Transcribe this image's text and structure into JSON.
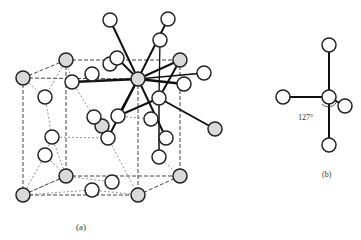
{
  "figure": {
    "panel_a": {
      "label": "(a)",
      "description": "Crystal structure unit cell with dashed cell edges, shaded and open atoms, one shaded atom with bold coordination bonds"
    },
    "panel_b": {
      "label": "(b)",
      "angle_label": "127°",
      "description": "Coordination geometry of one atom with four bonded neighbours"
    },
    "colors": {
      "shaded_atom": "#d9d9d9",
      "open_atom": "#ffffff",
      "outline": "#222222"
    }
  }
}
